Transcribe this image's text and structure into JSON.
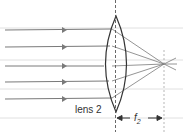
{
  "diagram": {
    "lens_label": "lens 2",
    "focal_label": "f",
    "focal_subscript": "2",
    "ray_count": 5,
    "colors": {
      "ray": "#7a7a7a",
      "lens": "#333333",
      "grid": "#d0d0d0"
    }
  }
}
